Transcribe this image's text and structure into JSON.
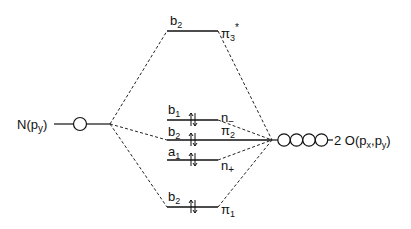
{
  "left_fragment": {
    "label": "N(p",
    "sub": "y",
    "close": ")"
  },
  "right_fragment": {
    "prefix": "2 O(p",
    "sub1": "x",
    "comma": ",p",
    "sub2": "y",
    "close": ")"
  },
  "levels": [
    {
      "id": "pi3star",
      "sym": "b",
      "sym_sub": "2",
      "mo": "π",
      "mo_sub": "3",
      "mo_sup": "*",
      "electrons": 0
    },
    {
      "id": "n_minus",
      "sym": "b",
      "sym_sub": "1",
      "mo": "n",
      "mo_sub": "−",
      "mo_sup": "",
      "electrons": 2
    },
    {
      "id": "pi2",
      "sym": "b",
      "sym_sub": "2",
      "mo": "π",
      "mo_sub": "2",
      "mo_sup": "",
      "electrons": 2
    },
    {
      "id": "n_plus",
      "sym": "a",
      "sym_sub": "1",
      "mo": "n",
      "mo_sub": "+",
      "mo_sup": "",
      "electrons": 2
    },
    {
      "id": "pi1",
      "sym": "b",
      "sym_sub": "2",
      "mo": "π",
      "mo_sub": "1",
      "mo_sup": "",
      "electrons": 2
    }
  ],
  "right_orbital_count": 4,
  "left_orbital_count": 1
}
